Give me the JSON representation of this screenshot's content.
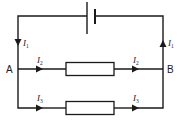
{
  "diagram": {
    "type": "circuit",
    "nodes": {
      "A": {
        "label": "A"
      },
      "B": {
        "label": "B"
      }
    },
    "currents": {
      "left_main": {
        "symbol": "I",
        "subscript": "1",
        "direction": "down"
      },
      "right_main": {
        "symbol": "I",
        "subscript": "1",
        "direction": "up"
      },
      "upper_in": {
        "symbol": "I",
        "subscript": "2",
        "direction": "right"
      },
      "upper_out": {
        "symbol": "I",
        "subscript": "2",
        "direction": "right"
      },
      "lower_in": {
        "symbol": "I",
        "subscript": "3",
        "direction": "right"
      },
      "lower_out": {
        "symbol": "I",
        "subscript": "3",
        "direction": "right"
      }
    },
    "components": [
      {
        "id": "battery",
        "kind": "cell",
        "position": "top"
      },
      {
        "id": "resistor-upper",
        "kind": "resistor",
        "branch": "upper"
      },
      {
        "id": "resistor-lower",
        "kind": "resistor",
        "branch": "lower"
      }
    ],
    "colors": {
      "line": "#1a1a1a",
      "background": "#ffffff"
    }
  }
}
